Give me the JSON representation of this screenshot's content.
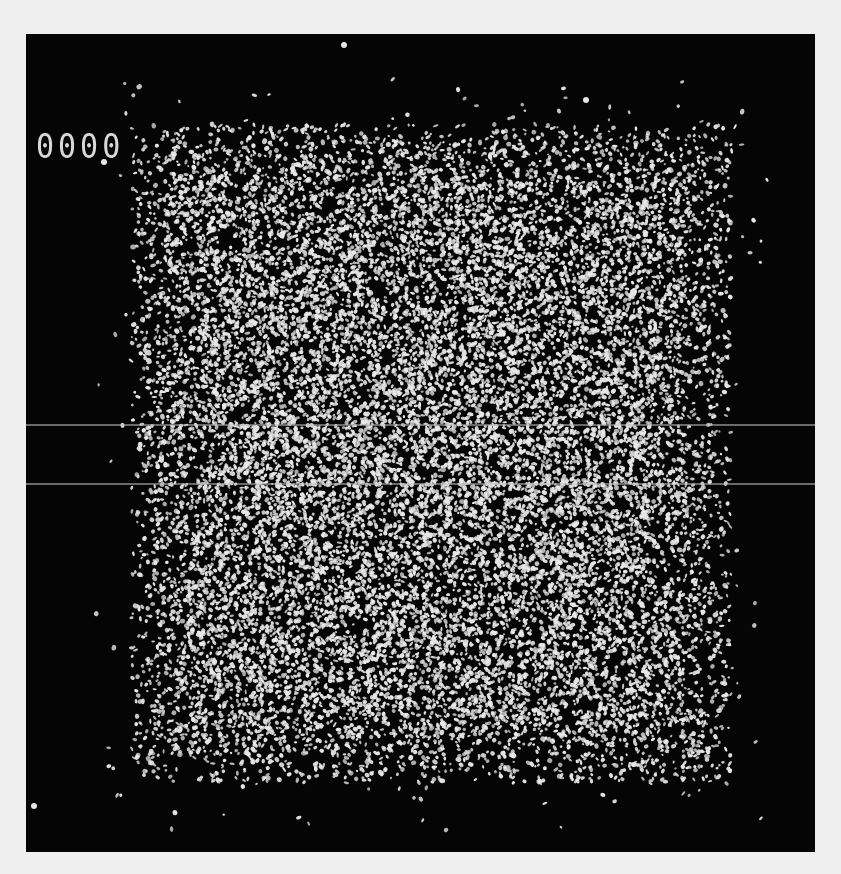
{
  "image": {
    "description": "Speckle / random dot field displayed on dark screen",
    "background_color": "#efefef",
    "screen_color": "#050505",
    "dot_color": "#e8e8e8"
  },
  "counter": {
    "label": "0000"
  },
  "field": {
    "center_x": 405,
    "center_y": 420,
    "half_width": 300,
    "half_height": 330,
    "dot_count": 26000,
    "seed": 12345
  },
  "scanlines": [
    {
      "y": 390,
      "x_from": 0,
      "x_to": 789
    },
    {
      "y": 449,
      "x_from": 0,
      "x_to": 789
    }
  ],
  "isolated_dots": [
    {
      "x": 318,
      "y": 11,
      "r": 3
    },
    {
      "x": 560,
      "y": 66,
      "r": 3
    },
    {
      "x": 8,
      "y": 772,
      "r": 3
    },
    {
      "x": 78,
      "y": 128,
      "r": 3
    }
  ]
}
